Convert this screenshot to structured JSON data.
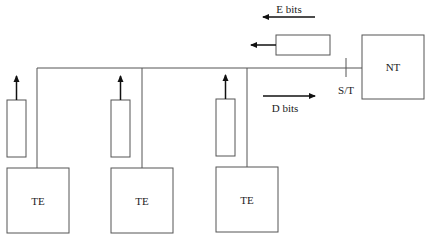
{
  "diagram": {
    "type": "ISDN S/T bus contention diagram",
    "colors": {
      "line": "#555555",
      "arrow": "#111111",
      "text": "#222222",
      "background": "#ffffff"
    },
    "nodes": {
      "nt": {
        "label": "NT"
      },
      "te": [
        {
          "label": "TE"
        },
        {
          "label": "TE"
        },
        {
          "label": "TE"
        }
      ]
    },
    "labels": {
      "e_bits": "E bits",
      "d_bits": "D bits",
      "reference_point": "S/T"
    },
    "arrows": {
      "e_bits_direction": "left (NT to TEs)",
      "d_bits_direction": "right (TEs to NT)",
      "te_outputs": "up (TE to bus)"
    }
  }
}
